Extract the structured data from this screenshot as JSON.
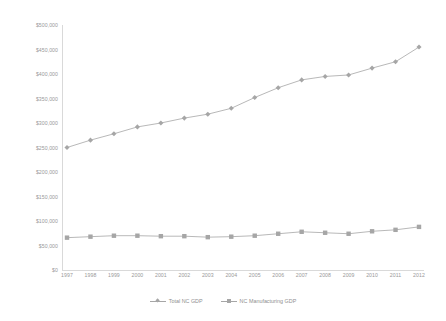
{
  "chart_data": {
    "type": "line",
    "title": "",
    "xlabel": "",
    "ylabel": "",
    "grid": false,
    "legend_position": "bottom",
    "x": [
      1997,
      1998,
      1999,
      2000,
      2001,
      2002,
      2003,
      2004,
      2005,
      2006,
      2007,
      2008,
      2009,
      2010,
      2011,
      2012
    ],
    "categories": [
      "1997",
      "1998",
      "1999",
      "2000",
      "2001",
      "2002",
      "2003",
      "2004",
      "2005",
      "2006",
      "2007",
      "2008",
      "2009",
      "2010",
      "2011",
      "2012"
    ],
    "ylim": [
      0,
      500000
    ],
    "yticks": [
      0,
      50000,
      100000,
      150000,
      200000,
      250000,
      300000,
      350000,
      400000,
      450000,
      500000
    ],
    "ytick_labels": [
      "$0",
      "$50,000",
      "$100,000",
      "$150,000",
      "$200,000",
      "$250,000",
      "$300,000",
      "$350,000",
      "$400,000",
      "$450,000",
      "$500,000"
    ],
    "series": [
      {
        "name": "Total NC GDP",
        "marker": "diamond",
        "color": "#a6a6a6",
        "values": [
          250000,
          265000,
          278000,
          292000,
          300000,
          310000,
          318000,
          330000,
          352000,
          372000,
          388000,
          395000,
          398000,
          412000,
          425000,
          455000
        ]
      },
      {
        "name": "NC Manufacturing GDP",
        "marker": "square",
        "color": "#a6a6a6",
        "values": [
          66000,
          68000,
          70000,
          70000,
          69000,
          69000,
          67000,
          68000,
          70000,
          74000,
          78000,
          76000,
          74000,
          79000,
          82000,
          88000
        ]
      }
    ]
  },
  "legend": {
    "items": [
      {
        "label": "Total NC GDP",
        "marker": "diamond"
      },
      {
        "label": "NC Manufacturing GDP",
        "marker": "square"
      }
    ]
  },
  "colors": {
    "line": "#a6a6a6",
    "marker": "#a6a6a6",
    "axis": "#d9d9d9",
    "text": "#999999"
  }
}
